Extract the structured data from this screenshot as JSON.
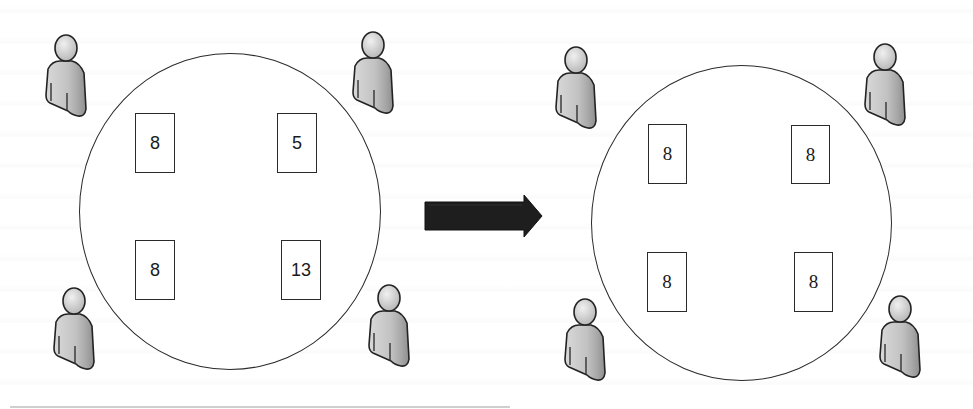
{
  "diagram": {
    "before": {
      "label": "before",
      "cards": [
        {
          "position": "top-left",
          "value": "8"
        },
        {
          "position": "top-right",
          "value": "5"
        },
        {
          "position": "bottom-left",
          "value": "8"
        },
        {
          "position": "bottom-right",
          "value": "13"
        }
      ],
      "players": [
        "top-left",
        "top-right",
        "bottom-left",
        "bottom-right"
      ]
    },
    "after": {
      "label": "after",
      "cards": [
        {
          "position": "top-left",
          "value": "8"
        },
        {
          "position": "top-right",
          "value": "8"
        },
        {
          "position": "bottom-left",
          "value": "8"
        },
        {
          "position": "bottom-right",
          "value": "8"
        }
      ],
      "players": [
        "top-left",
        "top-right",
        "bottom-left",
        "bottom-right"
      ]
    },
    "transition": {
      "icon": "right-arrow-icon",
      "color": "#1e1e1e"
    },
    "colors": {
      "outline": "#2a2a2a",
      "person_fill": "#c4c4c4",
      "person_shade": "#9a9a9a"
    }
  }
}
